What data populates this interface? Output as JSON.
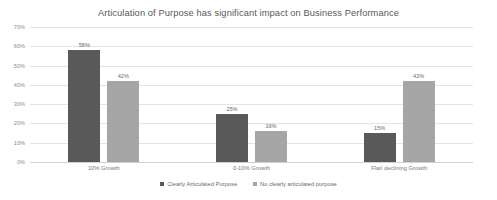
{
  "chart_data": {
    "type": "bar",
    "title": "Articulation of Purpose has significant impact on Business Performance",
    "xlabel": "",
    "ylabel": "",
    "categories": [
      "10%  Growth",
      "0-10% Growth",
      "Flat/ declining Growth"
    ],
    "series": [
      {
        "name": "Clearly Articulated Purpose",
        "color": "#595959",
        "values": [
          58,
          25,
          15
        ],
        "labels": [
          "58%",
          "25%",
          "15%"
        ]
      },
      {
        "name": "No clearly articulated purpose",
        "color": "#a6a6a6",
        "values": [
          42,
          16,
          42
        ],
        "labels": [
          "42%",
          "16%",
          "42%"
        ]
      }
    ],
    "ylim": [
      0,
      70
    ],
    "yticks": [
      0,
      10,
      20,
      30,
      40,
      50,
      60,
      70
    ],
    "ytick_labels": [
      "0%",
      "10%",
      "20%",
      "30%",
      "40%",
      "50%",
      "60%",
      "70%"
    ],
    "grid": true,
    "legend_position": "bottom",
    "value_labels": true
  },
  "colors": {
    "series_dark": "#595959",
    "series_light": "#a6a6a6",
    "gridline": "#e4e4e4",
    "axis_text": "#8c8c8c",
    "title_text": "#595959",
    "background": "#ffffff"
  }
}
